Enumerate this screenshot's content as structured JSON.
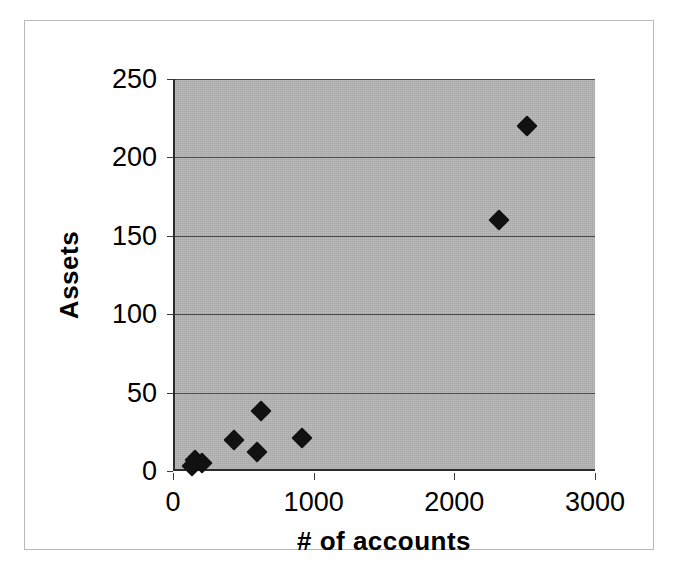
{
  "figure": {
    "background_color": "#ffffff",
    "plot_background_color": "#a8a8a8",
    "marker_color": "#111111",
    "axis_color": "#2b2b2b",
    "gridline_color": "#4a4a4a"
  },
  "chart_data": {
    "type": "scatter",
    "title": "",
    "xlabel": "# of accounts",
    "ylabel": "Assets",
    "xlim": [
      0,
      3000
    ],
    "ylim": [
      0,
      250
    ],
    "xticks": [
      0,
      1000,
      2000,
      3000
    ],
    "yticks": [
      0,
      50,
      100,
      150,
      200,
      250
    ],
    "xtick_labels": [
      "0",
      "1000",
      "2000",
      "3000"
    ],
    "ytick_labels": [
      "0",
      "50",
      "100",
      "150",
      "200",
      "250"
    ],
    "grid": "horizontal",
    "legend": "none",
    "marker_style": "filled-diamond",
    "series": [
      {
        "name": "Assets vs # of accounts",
        "points": [
          {
            "x": 120,
            "y": 3
          },
          {
            "x": 140,
            "y": 7
          },
          {
            "x": 190,
            "y": 5
          },
          {
            "x": 420,
            "y": 20
          },
          {
            "x": 580,
            "y": 12
          },
          {
            "x": 610,
            "y": 38
          },
          {
            "x": 900,
            "y": 21
          },
          {
            "x": 2300,
            "y": 160
          },
          {
            "x": 2500,
            "y": 220
          }
        ]
      }
    ]
  }
}
